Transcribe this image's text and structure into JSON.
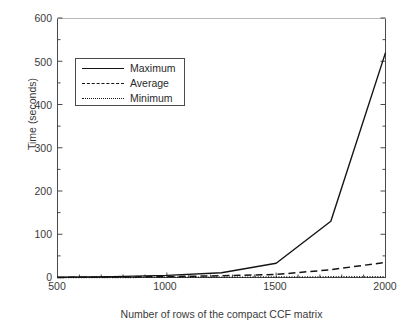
{
  "chart_data": {
    "type": "line",
    "title": "",
    "xlabel": "Number of rows of the compact CCF matrix",
    "ylabel": "Time (seconds)",
    "xlim": [
      500,
      2000
    ],
    "ylim": [
      0,
      600
    ],
    "xticks": [
      500,
      1000,
      1500,
      2000
    ],
    "yticks": [
      0,
      100,
      200,
      300,
      400,
      500,
      600
    ],
    "xtick_labels": [
      "500",
      "1000",
      "1500",
      "2000"
    ],
    "ytick_labels": [
      "0",
      "100",
      "200",
      "300",
      "400",
      "500",
      "600"
    ],
    "grid": false,
    "legend_position": "upper left",
    "x": [
      500,
      750,
      1000,
      1250,
      1500,
      1750,
      2000
    ],
    "series": [
      {
        "name": "Maximum",
        "style": "solid",
        "color": "#141414",
        "values": [
          0.5,
          2,
          5,
          11,
          33,
          130,
          520
        ]
      },
      {
        "name": "Average",
        "style": "dashed",
        "color": "#141414",
        "values": [
          0.2,
          0.8,
          2,
          4,
          7,
          18,
          35
        ]
      },
      {
        "name": "Minimum",
        "style": "dotted",
        "color": "#141414",
        "values": [
          0.1,
          0.2,
          0.4,
          0.7,
          1,
          1.5,
          2
        ]
      }
    ]
  },
  "legend": {
    "entries": [
      {
        "label": "Maximum",
        "style": "solid"
      },
      {
        "label": "Average",
        "style": "dashed"
      },
      {
        "label": "Minimum",
        "style": "dotted"
      }
    ]
  },
  "style": {
    "background": "#ffffff",
    "axis_color": "#4a4a4a",
    "text_color": "#3a3a3a",
    "line_color": "#141414"
  }
}
